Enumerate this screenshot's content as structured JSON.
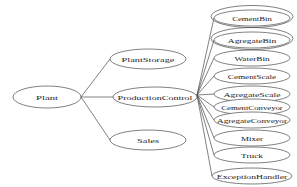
{
  "diagram": {
    "type": "tree-graph",
    "background_color": "#ffffff",
    "stroke_color": "#4a4a4a",
    "text_color": "#1c1c1c",
    "root": {
      "id": "plant",
      "label": "Plant",
      "cx": 47,
      "cy": 97,
      "rx": 34,
      "ry": 11,
      "double_outline": false
    },
    "level1": [
      {
        "id": "plantstorage",
        "label": "PlantStorage",
        "cx": 148,
        "cy": 59,
        "rx": 38,
        "ry": 10,
        "double_outline": false
      },
      {
        "id": "productioncontrol",
        "label": "ProductionControl",
        "cx": 155,
        "cy": 97,
        "rx": 42,
        "ry": 10,
        "double_outline": false
      },
      {
        "id": "sales",
        "label": "Sales",
        "cx": 148,
        "cy": 140,
        "rx": 38,
        "ry": 10,
        "double_outline": false
      }
    ],
    "level2": [
      {
        "id": "cementbin",
        "label": "CementBin",
        "cx": 252,
        "cy": 18,
        "rx": 38,
        "ry": 8,
        "double_outline": true
      },
      {
        "id": "agregatebin",
        "label": "AgregateBin",
        "cx": 252,
        "cy": 40,
        "rx": 38,
        "ry": 8,
        "double_outline": true
      },
      {
        "id": "waterbin",
        "label": "WaterBin",
        "cx": 252,
        "cy": 58,
        "rx": 38,
        "ry": 8,
        "double_outline": false
      },
      {
        "id": "cementscale",
        "label": "CementScale",
        "cx": 252,
        "cy": 76,
        "rx": 38,
        "ry": 8,
        "double_outline": false
      },
      {
        "id": "agregatescale",
        "label": "AgregateScale",
        "cx": 252,
        "cy": 94,
        "rx": 38,
        "ry": 8,
        "double_outline": false
      },
      {
        "id": "cementconveyor",
        "label": "CementConveyor",
        "cx": 252,
        "cy": 107,
        "rx": 38,
        "ry": 8,
        "double_outline": false
      },
      {
        "id": "agregateconveyor",
        "label": "AgregateConveyor",
        "cx": 252,
        "cy": 120,
        "rx": 38,
        "ry": 8,
        "double_outline": false
      },
      {
        "id": "mixer",
        "label": "Mixer",
        "cx": 252,
        "cy": 138,
        "rx": 38,
        "ry": 8,
        "double_outline": false
      },
      {
        "id": "truck",
        "label": "Truck",
        "cx": 252,
        "cy": 155,
        "rx": 38,
        "ry": 8,
        "double_outline": false
      },
      {
        "id": "exceptionhandler",
        "label": "ExceptionHandler",
        "cx": 252,
        "cy": 176,
        "rx": 40,
        "ry": 8,
        "double_outline": false
      }
    ],
    "hubs": {
      "plant_hub": {
        "x": 81,
        "y": 97
      },
      "production_hub": {
        "x": 197,
        "y": 95
      }
    },
    "edges": [
      {
        "from": "plant",
        "to": "plantstorage"
      },
      {
        "from": "plant",
        "to": "productioncontrol"
      },
      {
        "from": "plant",
        "to": "sales"
      },
      {
        "from": "productioncontrol",
        "to": "cementbin"
      },
      {
        "from": "productioncontrol",
        "to": "agregatebin"
      },
      {
        "from": "productioncontrol",
        "to": "waterbin"
      },
      {
        "from": "productioncontrol",
        "to": "cementscale"
      },
      {
        "from": "productioncontrol",
        "to": "agregatescale"
      },
      {
        "from": "productioncontrol",
        "to": "cementconveyor"
      },
      {
        "from": "productioncontrol",
        "to": "agregateconveyor"
      },
      {
        "from": "productioncontrol",
        "to": "mixer"
      },
      {
        "from": "productioncontrol",
        "to": "truck"
      },
      {
        "from": "productioncontrol",
        "to": "exceptionhandler"
      }
    ]
  }
}
